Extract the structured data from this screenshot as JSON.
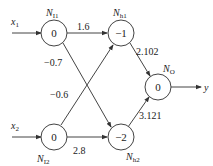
{
  "diagram": {
    "type": "neural-network",
    "inputs": [
      {
        "id": "x1",
        "label": "x",
        "sub": "1"
      },
      {
        "id": "x2",
        "label": "x",
        "sub": "2"
      }
    ],
    "output_label": "y",
    "nodes": {
      "NI1": {
        "name": "N",
        "sub": "I1",
        "value": "0"
      },
      "NI2": {
        "name": "N",
        "sub": "I2",
        "value": "0"
      },
      "Nh1": {
        "name": "N",
        "sub": "h1",
        "value": "−1"
      },
      "Nh2": {
        "name": "N",
        "sub": "h2",
        "value": "−2"
      },
      "NO": {
        "name": "N",
        "sub": "O",
        "value": "0"
      }
    },
    "edges": [
      {
        "from": "NI1",
        "to": "Nh1",
        "weight": "1.6"
      },
      {
        "from": "NI1",
        "to": "Nh2",
        "weight": "−0.7"
      },
      {
        "from": "NI2",
        "to": "Nh1",
        "weight": "−0.6"
      },
      {
        "from": "NI2",
        "to": "Nh2",
        "weight": "2.8"
      },
      {
        "from": "Nh1",
        "to": "NO",
        "weight": "2.102"
      },
      {
        "from": "Nh2",
        "to": "NO",
        "weight": "3.121"
      }
    ]
  }
}
